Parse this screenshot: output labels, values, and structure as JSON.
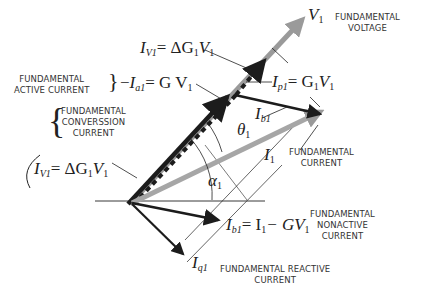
{
  "diagram": {
    "labels": {
      "voltage_symbol": "V",
      "voltage_sub": "1",
      "voltage_caption": [
        "FUNDAMENTAL",
        "VOLTAGE"
      ],
      "iv1_top": {
        "lhs": "I",
        "lhs_sub": "V1",
        "rhs": "= ΔG",
        "rhs_sub": "1",
        "tail": "V",
        "tail_sub": "1"
      },
      "ia1": {
        "lhs": "I",
        "lhs_sub": "a1",
        "rhs": "= G V",
        "rhs_sub": "1"
      },
      "active_caption": [
        "FUNDAMENTAL",
        "ACTIVE CURRENT"
      ],
      "conversion_caption": [
        "FUNDAMENTAL",
        "CONVERSSION",
        "CURRENT"
      ],
      "iv1_bottom": {
        "lhs": "I",
        "lhs_sub": "V1",
        "rhs": "= ΔG",
        "rhs_sub": "1",
        "tail": "V",
        "tail_sub": "1"
      },
      "ip1": {
        "lhs": "I",
        "lhs_sub": "p1",
        "rhs": "= G",
        "rhs_sub": "1",
        "tail": "V",
        "tail_sub": "1"
      },
      "ib1_upper": {
        "lhs": "I",
        "lhs_sub": "b1"
      },
      "theta": {
        "sym": "θ",
        "sub": "1"
      },
      "alpha": {
        "sym": "α",
        "sub": "1"
      },
      "i1": {
        "sym": "I",
        "sub": "1"
      },
      "current_caption": [
        "FUNDAMENTAL",
        "CURRENT"
      ],
      "ib1_lower": {
        "lhs": "I",
        "lhs_sub": "b1",
        "rhs": "= I",
        "rhs_sub": "1",
        "tail": "− GV",
        "tail_sub": "1"
      },
      "nonactive_caption": [
        "FUNDAMENTAL",
        "NONACTIVE",
        "CURRENT"
      ],
      "iq1": {
        "sym": "I",
        "sub": "q1"
      },
      "reactive_caption": [
        "FUNDAMENTAL REACTIVE",
        "CURRENT"
      ]
    },
    "colors": {
      "voltage": "#9a9a9a",
      "current": "#a6a6a6",
      "vectors": "#1c1c1c",
      "lines": "#222222"
    }
  }
}
